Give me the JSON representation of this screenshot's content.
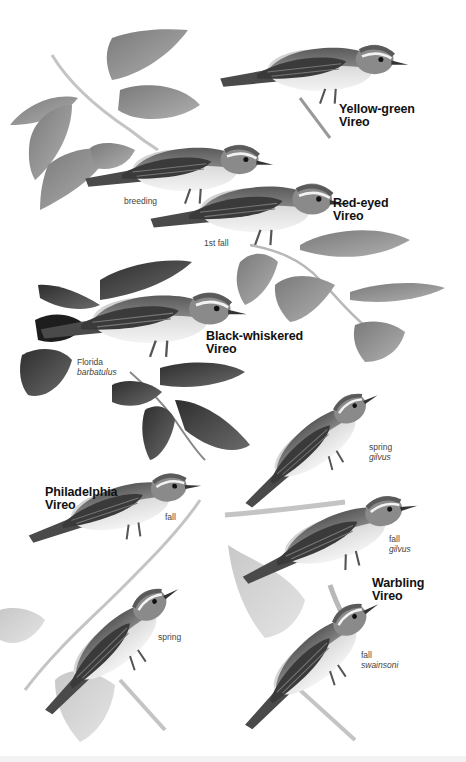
{
  "plate": {
    "subject": "Vireos",
    "background": "#ffffff",
    "ink": "#111111"
  },
  "species": [
    {
      "id": "yellow-green",
      "name_line1": "Yellow-green",
      "name_line2": "Vireo",
      "x": 339,
      "y": 103
    },
    {
      "id": "red-eyed",
      "name_line1": "Red-eyed",
      "name_line2": "Vireo",
      "x": 333,
      "y": 197
    },
    {
      "id": "black-whiskered",
      "name_line1": "Black-whiskered",
      "name_line2": "Vireo",
      "x": 206,
      "y": 330
    },
    {
      "id": "philadelphia",
      "name_line1": "Philadelphia",
      "name_line2": "Vireo",
      "x": 45,
      "y": 486
    },
    {
      "id": "warbling",
      "name_line1": "Warbling",
      "name_line2": "Vireo",
      "x": 372,
      "y": 577
    }
  ],
  "forms": [
    {
      "id": "red-eyed-breeding",
      "line1": "breeding",
      "line2": "",
      "x": 124,
      "y": 197
    },
    {
      "id": "red-eyed-1st-fall",
      "line1": "1st fall",
      "line2": "",
      "x": 204,
      "y": 239
    },
    {
      "id": "black-whiskered-florida",
      "line1": "Florida",
      "line2": "barbatulus",
      "x": 77,
      "y": 358
    },
    {
      "id": "philadelphia-fall",
      "line1": "fall",
      "line2": "",
      "x": 165,
      "y": 513
    },
    {
      "id": "warbling-spring-gilvus",
      "line1": "spring",
      "line2": "gilvus",
      "x": 369,
      "y": 443
    },
    {
      "id": "warbling-fall-gilvus",
      "line1": "fall",
      "line2": "gilvus",
      "x": 389,
      "y": 535
    },
    {
      "id": "philadelphia-spring",
      "line1": "spring",
      "line2": "",
      "x": 158,
      "y": 633
    },
    {
      "id": "warbling-fall-swainsoni",
      "line1": "fall",
      "line2": "swainsoni",
      "x": 361,
      "y": 651
    }
  ],
  "colors": {
    "bird_back": "#6b6b6b",
    "bird_wing": "#3a3a3a",
    "bird_belly": "#e6e6e6",
    "leaf_light": "#9a9a9a",
    "leaf_dark": "#4a4a4a",
    "branch": "#bdbdbd"
  }
}
